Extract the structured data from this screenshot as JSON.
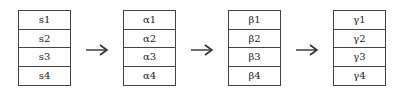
{
  "diagram": {
    "stages": [
      {
        "name": "s",
        "cells": [
          "s1",
          "s2",
          "s3",
          "s4"
        ]
      },
      {
        "name": "alpha",
        "cells": [
          "α1",
          "α2",
          "α3",
          "α4"
        ]
      },
      {
        "name": "beta",
        "cells": [
          "β1",
          "β2",
          "β3",
          "β4"
        ]
      },
      {
        "name": "gamma",
        "cells": [
          "γ1",
          "γ2",
          "γ3",
          "γ4"
        ]
      }
    ],
    "arrows": [
      "right-arrow",
      "right-arrow",
      "right-arrow"
    ],
    "colors": {
      "stroke": "#444444",
      "background": "#ffffff",
      "text": "#222222"
    }
  }
}
